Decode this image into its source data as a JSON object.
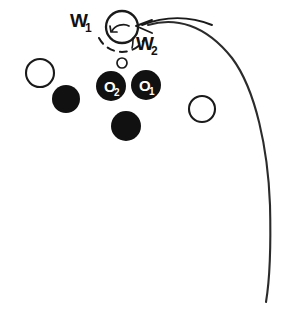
{
  "figure": {
    "background_color": "#ffffff",
    "stroke_color": "#1a1a1a",
    "fill_color": "#111111",
    "label_color_on_fill": "#ffffff",
    "width": 303,
    "height": 318
  },
  "labels": {
    "w1": {
      "base": "W",
      "sub": "1"
    },
    "w2": {
      "base": "W",
      "sub": "2"
    },
    "o1": {
      "base": "O",
      "sub": "1"
    },
    "o2": {
      "base": "O",
      "sub": "2"
    }
  },
  "nodes": [
    {
      "name": "w1-circle",
      "kind": "outline-circle",
      "cx": 122,
      "cy": 27,
      "r": 16,
      "stroke_width": 2.2
    },
    {
      "name": "small-open-circle",
      "kind": "outline-circle",
      "cx": 122,
      "cy": 63,
      "r": 5,
      "stroke_width": 1.6
    },
    {
      "name": "open-circle-left",
      "kind": "outline-circle",
      "cx": 40,
      "cy": 73,
      "r": 14,
      "stroke_width": 2.0
    },
    {
      "name": "open-circle-right",
      "kind": "outline-circle",
      "cx": 202,
      "cy": 109,
      "r": 13,
      "stroke_width": 2.0
    },
    {
      "name": "filled-circle-o2",
      "kind": "filled-circle",
      "cx": 111,
      "cy": 86,
      "r": 15,
      "label": "O2"
    },
    {
      "name": "filled-circle-o1",
      "kind": "filled-circle",
      "cx": 146,
      "cy": 85,
      "r": 15,
      "label": "O1"
    },
    {
      "name": "filled-circle-left",
      "kind": "filled-circle",
      "cx": 66,
      "cy": 99,
      "r": 14,
      "label": ""
    },
    {
      "name": "filled-circle-bottom",
      "kind": "filled-circle",
      "cx": 126,
      "cy": 126,
      "r": 15,
      "label": ""
    }
  ],
  "annotations": {
    "dashed_arc": {
      "cx": 122,
      "cy": 30,
      "r": 26,
      "style": "dashed",
      "opening": "downward"
    },
    "spin_arrow": {
      "inside": "w1-circle",
      "direction": "counterclockwise"
    },
    "incoming_arrow": {
      "points_to": "w1-circle",
      "from_side": "right",
      "arrowhead": "left"
    },
    "long_curve": {
      "apex_x": 200,
      "apex_y": 20,
      "end_x": 268,
      "end_y": 302
    }
  }
}
